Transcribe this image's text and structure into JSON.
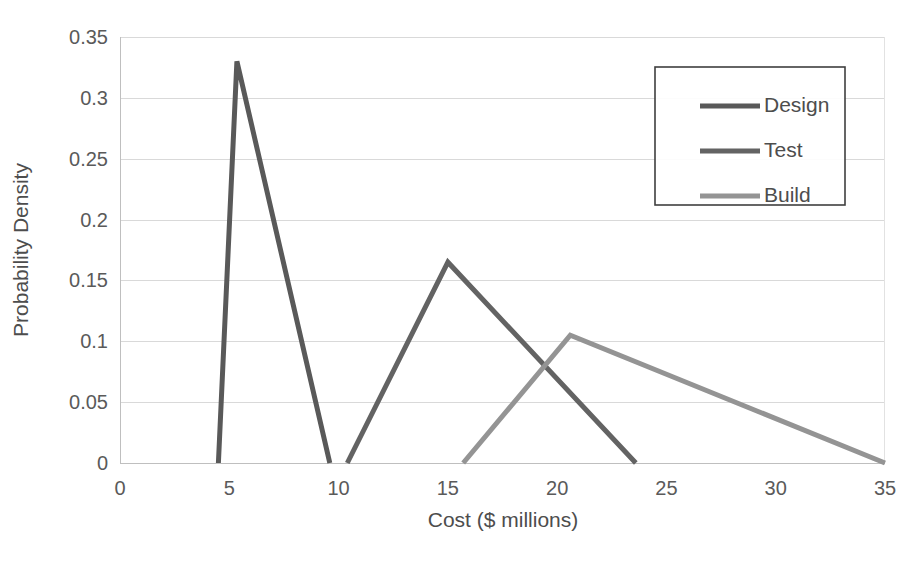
{
  "chart_data": {
    "type": "line",
    "title": "",
    "xlabel": "Cost ($ millions)",
    "ylabel": "Probability Density",
    "xlim": [
      0,
      35
    ],
    "ylim": [
      0,
      0.35
    ],
    "grid": true,
    "legend_position": "top-right",
    "xticks": [
      "0",
      "5",
      "10",
      "15",
      "20",
      "25",
      "30",
      "35"
    ],
    "xtick_values": [
      0,
      5,
      10,
      15,
      20,
      25,
      30,
      35
    ],
    "yticks": [
      "0",
      "0.05",
      "0.1",
      "0.15",
      "0.2",
      "0.25",
      "0.3",
      "0.35"
    ],
    "ytick_values": [
      0,
      0.05,
      0.1,
      0.15,
      0.2,
      0.25,
      0.3,
      0.35
    ],
    "series": [
      {
        "name": "Design",
        "color": "#595959",
        "linewidth": 5,
        "x": [
          4.5,
          5.35,
          9.6
        ],
        "y": [
          0,
          0.33,
          0
        ]
      },
      {
        "name": "Test",
        "color": "#636363",
        "linewidth": 5,
        "x": [
          10.4,
          15.0,
          23.6
        ],
        "y": [
          0,
          0.165,
          0
        ]
      },
      {
        "name": "Build",
        "color": "#949494",
        "linewidth": 5,
        "x": [
          15.7,
          20.6,
          35.0
        ],
        "y": [
          0,
          0.105,
          0
        ]
      }
    ]
  },
  "legend": {
    "entries": [
      {
        "label": "Design",
        "color": "#595959"
      },
      {
        "label": "Test",
        "color": "#636363"
      },
      {
        "label": "Build",
        "color": "#949494"
      }
    ]
  },
  "axes": {
    "x_title": "Cost ($ millions)",
    "y_title": "Probability Density"
  }
}
